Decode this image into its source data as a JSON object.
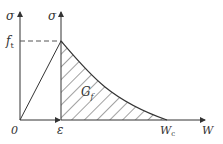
{
  "diagram": {
    "left_axis": {
      "label": "σ"
    },
    "right_axis": {
      "label": "σ"
    },
    "peak_label": "f",
    "peak_label_sub": "t",
    "origin_label": "0",
    "strain_label": "ε",
    "area_label": "G",
    "area_label_sub": "f",
    "crack_label": "W",
    "crack_label_sub": "c",
    "x_axis_label": "W",
    "colors": {
      "line": "#333333",
      "hatch": "#444444",
      "dash": "#555555"
    }
  }
}
